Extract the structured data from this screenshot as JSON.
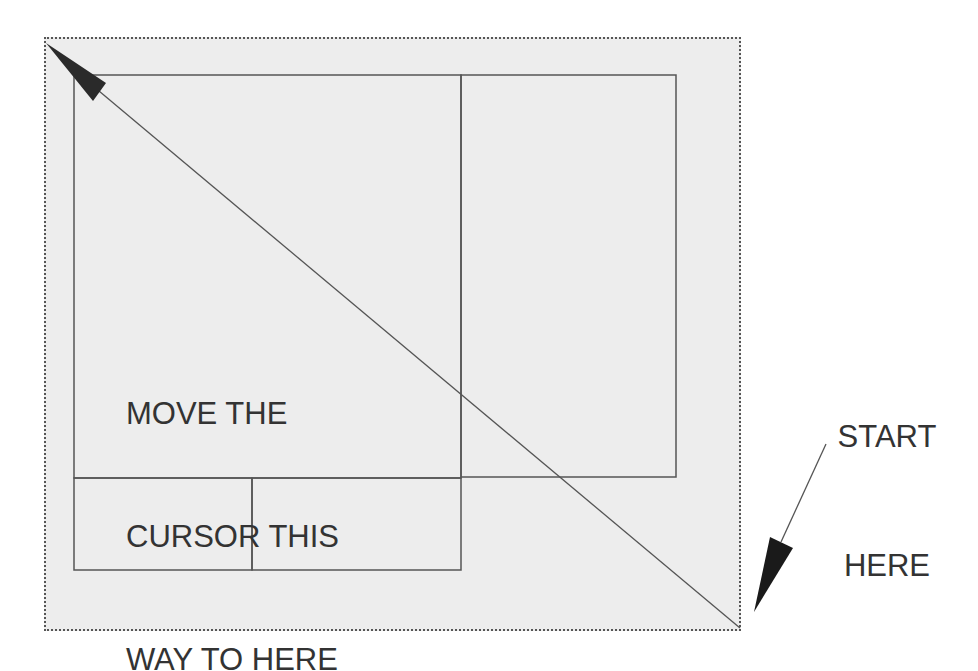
{
  "diagram": {
    "type": "drag-selection-instruction",
    "instruction_text": {
      "lines": [
        "MOVE THE",
        "CURSOR THIS",
        "WAY TO HERE"
      ]
    },
    "start_text": {
      "lines": [
        "START",
        "HERE"
      ]
    },
    "colors": {
      "selection_fill": "#ededed",
      "outline": "#555555",
      "arrow": "#222222",
      "text": "#333333"
    },
    "regions": [
      {
        "name": "main-left-panel",
        "x": 74,
        "y": 75,
        "w": 387,
        "h": 403
      },
      {
        "name": "main-right-panel",
        "x": 461,
        "y": 75,
        "w": 215,
        "h": 402
      },
      {
        "name": "bottom-left-panel",
        "x": 74,
        "y": 478,
        "w": 178,
        "h": 92
      },
      {
        "name": "bottom-right-panel",
        "x": 252,
        "y": 478,
        "w": 209,
        "h": 92
      }
    ]
  }
}
